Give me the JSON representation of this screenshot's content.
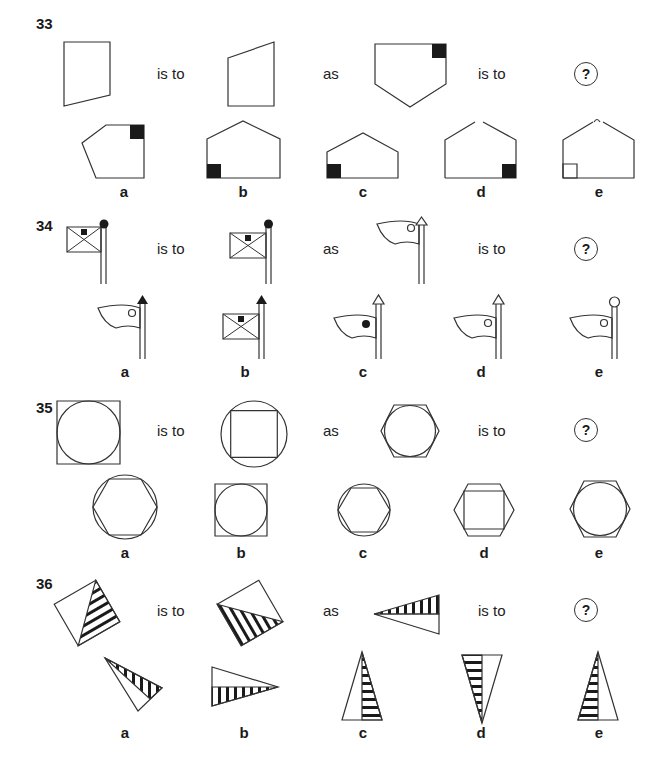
{
  "connectors": {
    "is_to": "is to",
    "as": "as",
    "unknown": "?"
  },
  "option_labels": [
    "a",
    "b",
    "c",
    "d",
    "e"
  ],
  "questions": [
    {
      "number": "33",
      "stem": [
        "pentagon-narrow",
        "pentagon-narrow-flipped",
        "pentagon-with-black-square-top-right"
      ],
      "options": [
        "a",
        "b",
        "c",
        "d",
        "e"
      ]
    },
    {
      "number": "34",
      "stem": [
        "envelope-flag-black-ball",
        "envelope-flag-black-ball-mirrored",
        "pennant-flag-white-arrow"
      ],
      "options": [
        "a",
        "b",
        "c",
        "d",
        "e"
      ]
    },
    {
      "number": "35",
      "stem": [
        "circle-in-square",
        "square-in-circle",
        "circle-in-hexagon"
      ],
      "options": [
        "a",
        "b",
        "c",
        "d",
        "e"
      ]
    },
    {
      "number": "36",
      "stem": [
        "tilted-square-hatched-half",
        "tilted-square-hatched-half-rotated",
        "triangle-vertical-hatch"
      ],
      "options": [
        "a",
        "b",
        "c",
        "d",
        "e"
      ]
    }
  ]
}
